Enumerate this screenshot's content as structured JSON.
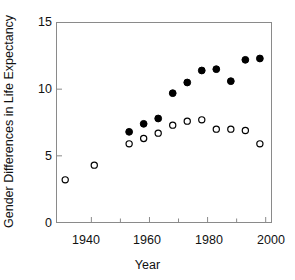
{
  "chart_data": {
    "type": "scatter",
    "title": "",
    "xlabel": "Year",
    "ylabel": "Gender Differences in Life Expectancy",
    "xlim": [
      1928,
      2002
    ],
    "ylim": [
      0,
      15
    ],
    "xticks": [
      1940,
      1960,
      1980,
      2000
    ],
    "xtick_labels": [
      "1940",
      "1960",
      "1980",
      "2000"
    ],
    "xminor_ticks": [
      1950,
      1970,
      1990
    ],
    "yticks": [
      0,
      5,
      10,
      15
    ],
    "ytick_labels": [
      "0",
      "5",
      "10",
      "15"
    ],
    "grid": false,
    "legend": "none",
    "series": [
      {
        "name": "filled-circles",
        "marker": "filled-circle",
        "color": "#000000",
        "points": [
          {
            "x": 1953,
            "y": 6.8
          },
          {
            "x": 1958,
            "y": 7.4
          },
          {
            "x": 1963,
            "y": 7.8
          },
          {
            "x": 1968,
            "y": 9.7
          },
          {
            "x": 1973,
            "y": 10.5
          },
          {
            "x": 1978,
            "y": 11.4
          },
          {
            "x": 1983,
            "y": 11.5
          },
          {
            "x": 1988,
            "y": 10.6
          },
          {
            "x": 1993,
            "y": 12.2
          },
          {
            "x": 1998,
            "y": 12.3
          }
        ]
      },
      {
        "name": "open-circles",
        "marker": "open-circle",
        "color": "#000000",
        "points": [
          {
            "x": 1931,
            "y": 3.2
          },
          {
            "x": 1941,
            "y": 4.3
          },
          {
            "x": 1953,
            "y": 5.9
          },
          {
            "x": 1958,
            "y": 6.3
          },
          {
            "x": 1963,
            "y": 6.7
          },
          {
            "x": 1968,
            "y": 7.3
          },
          {
            "x": 1973,
            "y": 7.6
          },
          {
            "x": 1978,
            "y": 7.7
          },
          {
            "x": 1983,
            "y": 7.0
          },
          {
            "x": 1988,
            "y": 7.0
          },
          {
            "x": 1993,
            "y": 6.9
          },
          {
            "x": 1998,
            "y": 5.9
          }
        ]
      }
    ]
  },
  "axes": {
    "frame_color": "#7a7a7a",
    "tick_color": "#7a7a7a"
  }
}
